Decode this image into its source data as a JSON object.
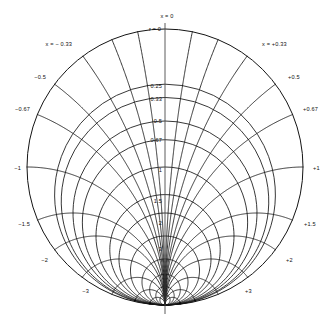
{
  "chart_data": {
    "type": "line",
    "title": "",
    "subtitle": "",
    "xlabel": "",
    "ylabel": "",
    "grid": true,
    "legend_position": "none",
    "geometry": {
      "center_x": 165,
      "center_y": 167,
      "radius": 138,
      "convergence_x": 165,
      "convergence_y": 305,
      "top_x": 165,
      "top_y": 29
    },
    "axis_label_top_x": "x = 0",
    "axis_label_top_r": "r = 0",
    "families": [
      {
        "name": "x-constant arcs (radial family)",
        "label_prefix": "x =",
        "values": [
          -3,
          -2,
          -1.5,
          -1,
          -0.67,
          -0.5,
          -0.33,
          0,
          0.33,
          0.5,
          0.67,
          1,
          1.5,
          2,
          3
        ]
      },
      {
        "name": "r-constant arcs (circular family)",
        "label_prefix": "r =",
        "values": [
          0,
          0.25,
          0.33,
          0.5,
          0.67,
          1,
          1.5,
          2,
          3
        ]
      }
    ],
    "labels_left": [
      {
        "text": "x = − 0.33",
        "value": -0.33,
        "x": 72,
        "y": 46
      },
      {
        "text": "−0.5",
        "value": -0.5,
        "x": 46,
        "y": 79
      },
      {
        "text": "−0.67",
        "value": -0.67,
        "x": 30,
        "y": 111
      },
      {
        "text": "−1",
        "value": -1,
        "x": 21,
        "y": 170
      },
      {
        "text": "−1.5",
        "value": -1.5,
        "x": 30,
        "y": 226
      },
      {
        "text": "−2",
        "value": -2,
        "x": 48,
        "y": 262
      },
      {
        "text": "−3",
        "value": -3,
        "x": 89,
        "y": 293
      }
    ],
    "labels_right": [
      {
        "text": "x = +0.33",
        "value": 0.33,
        "x": 262,
        "y": 46
      },
      {
        "text": "+0.5",
        "value": 0.5,
        "x": 288,
        "y": 79
      },
      {
        "text": "+0.67",
        "value": 0.67,
        "x": 303,
        "y": 111
      },
      {
        "text": "+1",
        "value": 1,
        "x": 313,
        "y": 170
      },
      {
        "text": "+1.5",
        "value": 1.5,
        "x": 304,
        "y": 226
      },
      {
        "text": "+2",
        "value": 2,
        "x": 286,
        "y": 262
      },
      {
        "text": "+3",
        "value": 3,
        "x": 245,
        "y": 293
      }
    ],
    "labels_center_axis": [
      {
        "text": "0.25",
        "value": 0.25,
        "x": 162,
        "y": 86
      },
      {
        "text": "0.33",
        "value": 0.33,
        "x": 162,
        "y": 99
      },
      {
        "text": "0.5",
        "value": 0.5,
        "x": 162,
        "y": 121
      },
      {
        "text": "0.67",
        "value": 0.67,
        "x": 162,
        "y": 140
      },
      {
        "text": "1",
        "value": 1,
        "x": 162,
        "y": 170
      },
      {
        "text": "1.5",
        "value": 1.5,
        "x": 162,
        "y": 201
      },
      {
        "text": "2",
        "value": 2,
        "x": 162,
        "y": 223
      },
      {
        "text": "3",
        "value": 3,
        "x": 162,
        "y": 249
      }
    ],
    "style": {
      "line_color": "#141414",
      "background": "#ffffff",
      "line_width_major": 0.85,
      "line_width_minor": 0.6
    }
  }
}
